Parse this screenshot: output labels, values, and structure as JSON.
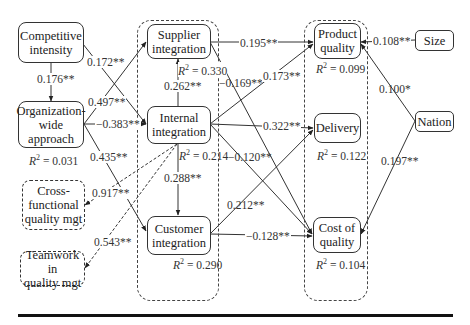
{
  "nodes": {
    "competitive_intensity": "Competitive intensity",
    "competitive_intensity_l1": "Competitive",
    "competitive_intensity_l2": "intensity",
    "org_wide_l1": "Organization-",
    "org_wide_l2": "wide",
    "org_wide_l3": "approach",
    "cross_functional_l1": "Cross-",
    "cross_functional_l2": "functional",
    "cross_functional_l3": "quality mgt",
    "teamwork_l1": "Teamwork in",
    "teamwork_l2": "quality mgt",
    "supplier_l1": "Supplier",
    "supplier_l2": "integration",
    "internal_l1": "Internal",
    "internal_l2": "integration",
    "customer_l1": "Customer",
    "customer_l2": "integration",
    "product_l1": "Product",
    "product_l2": "quality",
    "delivery": "Delivery",
    "cost_l1": "Cost of",
    "cost_l2": "quality",
    "size": "Size",
    "nation": "Nation"
  },
  "r_squared": {
    "org_wide": "= 0.031",
    "supplier": "= 0.330",
    "internal": "= 0.214",
    "customer": "= 0.290",
    "product_quality": "= 0.099",
    "delivery": "= 0.122",
    "cost_of_quality": "= 0.104",
    "prefix": "R",
    "sup": "2"
  },
  "paths": [
    {
      "from": "Competitive intensity",
      "to": "Organization-wide approach",
      "coef": "0.176**"
    },
    {
      "from": "Competitive intensity",
      "to": "Internal integration",
      "coef": "0.172**"
    },
    {
      "from": "Organization-wide approach",
      "to": "Supplier integration",
      "coef": "0.497**"
    },
    {
      "from": "Organization-wide approach",
      "to": "Internal integration",
      "coef": "0.383**"
    },
    {
      "from": "Organization-wide approach",
      "to": "Customer integration",
      "coef": "0.435**"
    },
    {
      "from": "Internal integration",
      "to": "Cross-functional quality mgt",
      "coef": "0.917**"
    },
    {
      "from": "Internal integration",
      "to": "Teamwork in quality mgt",
      "coef": "0.543**"
    },
    {
      "from": "Internal integration",
      "to": "Supplier integration",
      "coef": "0.262**"
    },
    {
      "from": "Internal integration",
      "to": "Customer integration",
      "coef": "0.288**"
    },
    {
      "from": "Supplier integration",
      "to": "Product quality",
      "coef": "0.195**"
    },
    {
      "from": "Supplier integration",
      "to": "Cost of quality",
      "coef": "−0.169**"
    },
    {
      "from": "Internal integration",
      "to": "Product quality",
      "coef": "0.173**"
    },
    {
      "from": "Internal integration",
      "to": "Delivery",
      "coef": "0.322**"
    },
    {
      "from": "Internal integration",
      "to": "Cost of quality",
      "coef": "−0.120**"
    },
    {
      "from": "Customer integration",
      "to": "Delivery",
      "coef": "0.212**"
    },
    {
      "from": "Customer integration",
      "to": "Cost of quality",
      "coef": "−0.128**"
    },
    {
      "from": "Size",
      "to": "Product quality",
      "coef": "0.108**"
    },
    {
      "from": "Nation",
      "to": "Product quality",
      "coef": "0.100*"
    },
    {
      "from": "Nation",
      "to": "Cost of quality",
      "coef": "0.197**"
    }
  ],
  "coefs": {
    "ci_org": "0.176**",
    "ci_int": "0.172**",
    "org_sup": "0.497**",
    "org_int": "−0.383**",
    "org_cus": "0.435**",
    "int_cross": "0.917**",
    "int_team": "0.543**",
    "int_sup": "0.262**",
    "int_cus": "0.288**",
    "sup_pq": "0.195**",
    "sup_coq": "−0.169**",
    "int_pq": "0.173**",
    "int_del": "0.322**",
    "int_coq": "−0.120**",
    "cus_del": "0.212**",
    "cus_coq": "−0.128**",
    "size_pq": "0.108**",
    "nat_pq": "0.100*",
    "nat_coq": "0.197**"
  },
  "colors": {
    "line": "#333333",
    "background": "#ffffff"
  }
}
